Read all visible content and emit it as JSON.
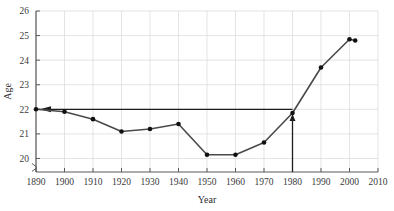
{
  "chart_data": {
    "type": "line",
    "title": "",
    "xlabel": "Year",
    "ylabel": "Age",
    "xlim": [
      1890,
      2010
    ],
    "ylim": [
      19.45,
      26
    ],
    "grid": true,
    "legend": "none",
    "x_ticks": [
      1890,
      1900,
      1910,
      1920,
      1930,
      1940,
      1950,
      1960,
      1970,
      1980,
      1990,
      2000,
      2010
    ],
    "y_ticks": [
      20,
      21,
      22,
      23,
      24,
      25,
      26
    ],
    "y_axis_break": true,
    "y_axis_break_note": "axis break below 20",
    "x": [
      1890,
      1900,
      1910,
      1920,
      1930,
      1940,
      1950,
      1960,
      1970,
      1980,
      1990,
      2000,
      2002
    ],
    "values": [
      22.0,
      21.9,
      21.6,
      21.1,
      21.2,
      21.4,
      20.15,
      20.15,
      20.65,
      21.85,
      23.7,
      24.85,
      24.8
    ],
    "series": [
      {
        "name": "Median age at first marriage",
        "x": [
          1890,
          1900,
          1910,
          1920,
          1930,
          1940,
          1950,
          1960,
          1970,
          1980,
          1990,
          2000,
          2002
        ],
        "values": [
          22.0,
          21.9,
          21.6,
          21.1,
          21.2,
          21.4,
          20.15,
          20.15,
          20.65,
          21.85,
          23.7,
          24.85,
          24.8
        ]
      }
    ],
    "annotations": [
      {
        "name": "reference-line-age-22",
        "type": "horizontal-line-with-left-arrow",
        "y": 22.0,
        "x_start": 1890,
        "x_end": 1980
      },
      {
        "name": "callout-arrow-1980",
        "type": "vertical-arrow-up",
        "x": 1980,
        "y_start": 19.45,
        "y_end": 21.85
      }
    ]
  },
  "labels": {
    "x_title": "Year",
    "y_title": "Age",
    "x_tick_1890": "1890",
    "x_tick_1900": "1900",
    "x_tick_1910": "1910",
    "x_tick_1920": "1920",
    "x_tick_1930": "1930",
    "x_tick_1940": "1940",
    "x_tick_1950": "1950",
    "x_tick_1960": "1960",
    "x_tick_1970": "1970",
    "x_tick_1980": "1980",
    "x_tick_1990": "1990",
    "x_tick_2000": "2000",
    "x_tick_2010": "2010",
    "y_tick_20": "20",
    "y_tick_21": "21",
    "y_tick_22": "22",
    "y_tick_23": "23",
    "y_tick_24": "24",
    "y_tick_25": "25",
    "y_tick_26": "26"
  },
  "colors": {
    "background": "#ffffff",
    "grid": "#d9d9dd",
    "axis": "#5a5a5a",
    "series": "#4a4a4a",
    "marker": "#111111",
    "annotation": "#1d1d1d",
    "text": "#2b2b2b"
  }
}
